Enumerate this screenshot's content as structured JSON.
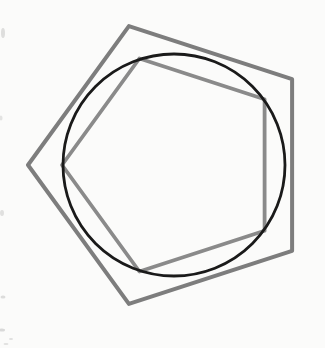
{
  "canvas": {
    "width": 325,
    "height": 348,
    "background_color": "#fbfbfa"
  },
  "figure": {
    "center": {
      "x": 174,
      "y": 165
    },
    "shapes": [
      {
        "id": "outer-pentagon",
        "type": "regular-polygon",
        "sides": 5,
        "radius": 146,
        "rotation_deg": 36,
        "stroke_color": "#7d7d7d",
        "stroke_width": 4
      },
      {
        "id": "inscribed-pentagon",
        "type": "regular-polygon",
        "sides": 5,
        "radius": 112,
        "rotation_deg": 36,
        "stroke_color": "#8a8a8a",
        "stroke_width": 3.8
      },
      {
        "id": "circle",
        "type": "circle",
        "radius": 111,
        "stroke_color": "#1a1a1a",
        "stroke_width": 2.8
      }
    ],
    "artifact_color": "#9a9a9a",
    "artifacts": [
      {
        "x": 3,
        "y": 33,
        "rx": 2.0,
        "ry": 5.0,
        "opacity": 0.3
      },
      {
        "x": 1,
        "y": 118,
        "rx": 1.5,
        "ry": 2.5,
        "opacity": 0.25
      },
      {
        "x": 2,
        "y": 213,
        "rx": 2.0,
        "ry": 3.0,
        "opacity": 0.28
      },
      {
        "x": 3,
        "y": 297,
        "rx": 2.5,
        "ry": 1.5,
        "opacity": 0.32
      },
      {
        "x": 2,
        "y": 330,
        "rx": 3.0,
        "ry": 1.5,
        "opacity": 0.35
      },
      {
        "x": 11,
        "y": 339,
        "rx": 2.0,
        "ry": 1.0,
        "opacity": 0.3
      },
      {
        "x": 6,
        "y": 344,
        "rx": 2.5,
        "ry": 1.0,
        "opacity": 0.28
      }
    ]
  }
}
